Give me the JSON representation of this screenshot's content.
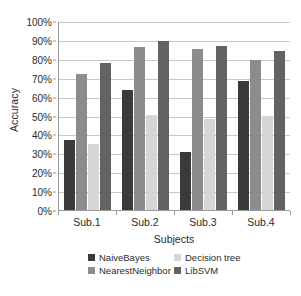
{
  "chart_data": {
    "type": "bar",
    "title": "",
    "xlabel": "Subjects",
    "ylabel": "Accuracy",
    "categories": [
      "Sub.1",
      "Sub.2",
      "Sub.3",
      "Sub.4"
    ],
    "ylim": [
      0,
      100
    ],
    "ytick_labels": [
      "0%",
      "10%",
      "20%",
      "30%",
      "40%",
      "50%",
      "60%",
      "70%",
      "80%",
      "90%",
      "100%"
    ],
    "ytick_values": [
      0,
      10,
      20,
      30,
      40,
      50,
      60,
      70,
      80,
      90,
      100
    ],
    "y_unit": "%",
    "grid": "horizontal",
    "legend_position": "bottom",
    "series": [
      {
        "name": "NaiveBayes",
        "color": "#3a3a3a",
        "values": [
          37,
          63.5,
          30.5,
          68
        ]
      },
      {
        "name": "Decision tree",
        "color": "#d6d6d6",
        "values": [
          35,
          50.5,
          48,
          49.5
        ]
      },
      {
        "name": "NearestNeighbor",
        "color": "#8c8c8c",
        "values": [
          72,
          86,
          85,
          79.5
        ]
      },
      {
        "name": "LibSVM",
        "color": "#636363",
        "values": [
          78,
          89.5,
          87,
          84
        ]
      }
    ],
    "series_draw_order": [
      "NaiveBayes",
      "NearestNeighbor",
      "Decision tree",
      "LibSVM"
    ]
  },
  "axis": {
    "y_title": "Accuracy",
    "x_title": "Subjects"
  },
  "legend": {
    "entries": [
      {
        "label": "NaiveBayes",
        "color": "#3a3a3a"
      },
      {
        "label": "Decision tree",
        "color": "#d6d6d6"
      },
      {
        "label": "NearestNeighbor",
        "color": "#8c8c8c"
      },
      {
        "label": "LibSVM",
        "color": "#636363"
      }
    ]
  }
}
